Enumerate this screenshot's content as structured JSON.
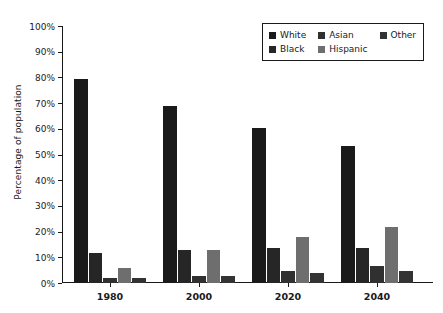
{
  "chart": {
    "type": "bar",
    "ylabel": "Percentage of population",
    "xlabel": "",
    "title": ""
  },
  "chart_data": {
    "type": "bar",
    "title": "",
    "xlabel": "",
    "ylabel": "Percentage of population",
    "categories": [
      "1980",
      "2000",
      "2020",
      "2040"
    ],
    "ylim": [
      0,
      100
    ],
    "ytick_values": [
      0,
      10,
      20,
      30,
      40,
      50,
      60,
      70,
      80,
      90,
      100
    ],
    "ytick_labels": [
      "0%",
      "10%",
      "20%",
      "30%",
      "40%",
      "50%",
      "60%",
      "70%",
      "80%",
      "90%",
      "100%"
    ],
    "grid": false,
    "legend_position": "upper right",
    "series": [
      {
        "name": "White",
        "color": "#1a1a1a",
        "values": [
          79.5,
          69.0,
          60.5,
          53.5
        ]
      },
      {
        "name": "Black",
        "color": "#262626",
        "values": [
          11.8,
          12.8,
          13.8,
          13.8
        ]
      },
      {
        "name": "Asian",
        "color": "#303030",
        "values": [
          1.8,
          2.9,
          4.8,
          6.7
        ]
      },
      {
        "name": "Hispanic",
        "color": "#6e6e6e",
        "values": [
          6.0,
          12.8,
          17.8,
          21.8
        ]
      },
      {
        "name": "Other",
        "color": "#333333",
        "values": [
          1.8,
          2.9,
          3.8,
          4.8
        ]
      }
    ]
  },
  "legend": {
    "rows": [
      [
        {
          "label": "White",
          "color": "#1a1a1a"
        },
        {
          "label": "Asian",
          "color": "#303030"
        },
        {
          "label": "Other",
          "color": "#333333"
        }
      ],
      [
        {
          "label": "Black",
          "color": "#262626"
        },
        {
          "label": "Hispanic",
          "color": "#6e6e6e"
        },
        {
          "label": "",
          "color": ""
        }
      ]
    ]
  },
  "colors": {
    "axis": "#1a1a1a",
    "background": "#ffffff",
    "text": "#1a1a1a"
  }
}
